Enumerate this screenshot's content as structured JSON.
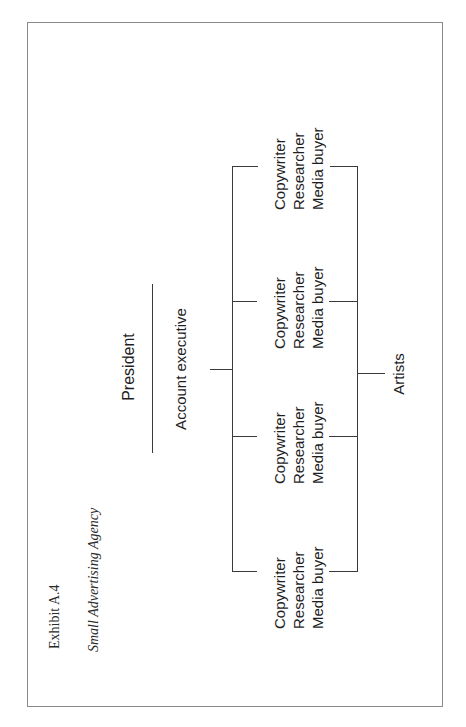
{
  "exhibit": {
    "label": "Exhibit A.4",
    "subtitle": "Small Advertising Agency"
  },
  "chart": {
    "top_role": "President",
    "second_role": "Account executive",
    "support_role": "Artists",
    "teams": [
      {
        "roles": [
          "Copywriter",
          "Researcher",
          "Media buyer"
        ]
      },
      {
        "roles": [
          "Copywriter",
          "Researcher",
          "Media buyer"
        ]
      },
      {
        "roles": [
          "Copywriter",
          "Researcher",
          "Media buyer"
        ]
      },
      {
        "roles": [
          "Copywriter",
          "Researcher",
          "Media buyer"
        ]
      }
    ]
  },
  "colors": {
    "line": "#3a3a3a",
    "frame": "#8a8a8a",
    "text": "#1e1e1e"
  }
}
